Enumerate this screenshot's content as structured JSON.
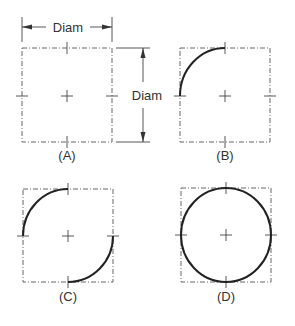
{
  "figure": {
    "dimension_label_horizontal": "Diam",
    "dimension_label_vertical": "Diam",
    "panels": [
      {
        "id": "A",
        "label": "(A)",
        "description": "Square box with center lines marked"
      },
      {
        "id": "B",
        "label": "(B)",
        "description": "First quarter arc drawn (upper-left)"
      },
      {
        "id": "C",
        "label": "(C)",
        "description": "Upper-left and lower-right arcs drawn"
      },
      {
        "id": "D",
        "label": "(D)",
        "description": "Complete circle"
      }
    ]
  },
  "colors": {
    "line": "#444444",
    "arc": "#222222",
    "text": "#333333"
  }
}
